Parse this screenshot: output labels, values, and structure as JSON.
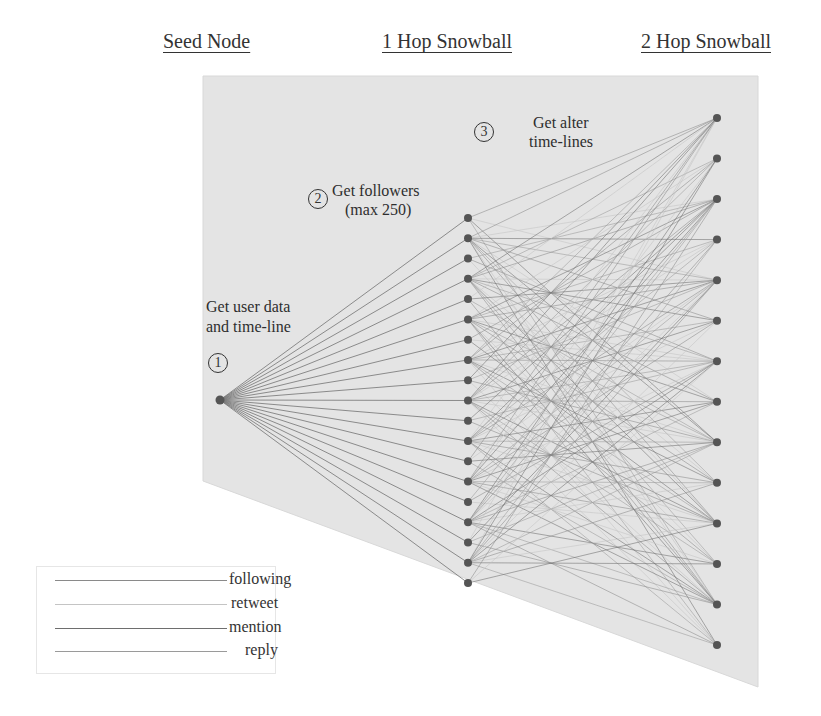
{
  "headers": {
    "seed": "Seed Node",
    "hop1": "1 Hop Snowball",
    "hop2": "2 Hop Snowball"
  },
  "steps": [
    {
      "number": "1",
      "text_line1": "Get user data",
      "text_line2": "and time-line"
    },
    {
      "number": "2",
      "text_line1": "Get followers",
      "text_line2": "(max 250)"
    },
    {
      "number": "3",
      "text_line1": "Get alter",
      "text_line2": "time-lines"
    }
  ],
  "legend": [
    {
      "label": "following",
      "color": "#8a8a8a",
      "width": 1.3
    },
    {
      "label": "retweet",
      "color": "#c4c4c4",
      "width": 1.2
    },
    {
      "label": "mention",
      "color": "#6e6e6e",
      "width": 1.4
    },
    {
      "label": "reply",
      "color": "#9a9a9a",
      "width": 1.1
    }
  ],
  "colors": {
    "background_panel": "#e4e4e4",
    "node": "#555555",
    "edge": "#8c8c8c",
    "text": "#2e2e2e"
  },
  "graph": {
    "panel_polygon": [
      [
        203,
        76
      ],
      [
        758,
        76
      ],
      [
        758,
        687
      ],
      [
        203,
        481
      ]
    ],
    "seed_node": {
      "x": 220,
      "y": 400
    },
    "hop1": {
      "x": 468,
      "y_start": 218,
      "y_end": 583,
      "count": 19,
      "hub_indices": [
        1,
        3,
        5,
        7,
        9,
        11,
        13,
        15,
        17
      ]
    },
    "hop2": {
      "x": 717,
      "y_start": 118,
      "y_end": 645,
      "count": 14
    }
  }
}
